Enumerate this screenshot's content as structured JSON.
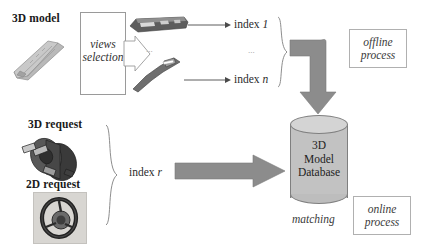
{
  "figure": {
    "background_color": "#ffffff"
  },
  "offline_branch": {
    "model_label": "3D model",
    "views_box": {
      "line1": "views",
      "line2": "selection"
    },
    "ellipsis_views": "...",
    "ellipsis_index": "...",
    "index_first": "index",
    "index_first_var": "1",
    "index_last": "index",
    "index_last_var": "n",
    "process_box": {
      "line1": "offline",
      "line2": "process"
    }
  },
  "online_branch": {
    "request_3d_label": "3D request",
    "request_2d_label": "2D request",
    "index_request": "index",
    "index_request_var": "r",
    "process_box": {
      "line1": "online",
      "line2": "process"
    }
  },
  "database": {
    "line1": "3D",
    "line2": "Model",
    "line3": "Database",
    "caption": "matching"
  },
  "colors": {
    "arrow_gray": "#8c8c8c",
    "cylinder_body": "#c2c2c2",
    "cylinder_top": "#d4d4d4",
    "line_gray": "#9a9a9a",
    "text_dark": "#1a1a1a"
  }
}
